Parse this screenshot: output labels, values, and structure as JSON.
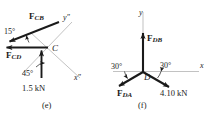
{
  "figure_e": {
    "caption": "(e)",
    "point_label": "C",
    "axes": {
      "x_label": "x″",
      "y_label": "y″"
    },
    "forces": [
      {
        "name": "F_CB",
        "symbol": "F",
        "subscript": "CB"
      },
      {
        "name": "F_CD",
        "symbol": "F",
        "subscript": "CD"
      }
    ],
    "magnitude": "1.5 kN",
    "angles": [
      {
        "value": "15°"
      },
      {
        "value": "45°"
      }
    ]
  },
  "figure_f": {
    "caption": "(f)",
    "point_label": "D",
    "axes": {
      "x_label": "x",
      "y_label": "y"
    },
    "forces": [
      {
        "name": "F_DB",
        "symbol": "F",
        "subscript": "DB"
      },
      {
        "name": "F_DA",
        "symbol": "F",
        "subscript": "DA"
      }
    ],
    "magnitude": "4.10 kN",
    "angles": [
      {
        "value": "30°"
      },
      {
        "value": "30°"
      }
    ]
  },
  "colors": {
    "ink": "#1a1a1a",
    "axis": "#9a9a9a",
    "background": "#ffffff"
  }
}
